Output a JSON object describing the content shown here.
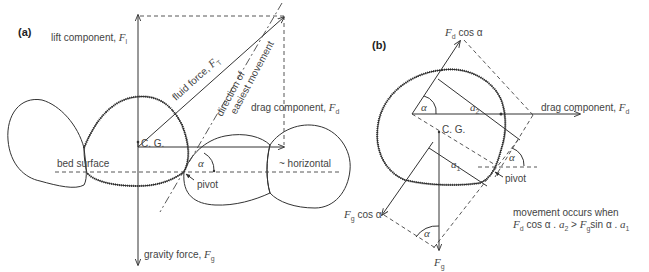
{
  "panel_a": {
    "label": "(a)",
    "lift_label": "lift component, ",
    "lift_symbol": "F",
    "lift_sub": "l",
    "fluid_label": "fluid force, ",
    "fluid_symbol": "F",
    "fluid_sub": "T",
    "direction_line1": "direction of",
    "direction_line2": "easiest movement",
    "drag_label": "drag component, ",
    "drag_symbol": "F",
    "drag_sub": "d",
    "cg_label": "C. G.",
    "bed_label": "bed surface",
    "horizontal_label": "~ horizontal",
    "alpha": "α",
    "pivot_label": "pivot",
    "gravity_label": "gravity force, ",
    "gravity_symbol": "F",
    "gravity_sub": "g"
  },
  "panel_b": {
    "label": "(b)",
    "fdcos_symbol": "F",
    "fdcos_sub": "d",
    "fdcos_text": " cos α",
    "a2_symbol": "a",
    "a2_sub": "2",
    "a1_symbol": "a",
    "a1_sub": "1",
    "drag_label": "drag component, ",
    "drag_symbol": "F",
    "drag_sub": "d",
    "cg_label": "C. G.",
    "alpha": "α",
    "pivot_label": "pivot",
    "fgcos_symbol": "F",
    "fgcos_sub": "g",
    "fgcos_text": " cos α",
    "fg_symbol": "F",
    "fg_sub": "g",
    "condition_line1": "movement occurs when",
    "condition_f1": "F",
    "condition_f1_sub": "d",
    "condition_mid1": " cos α . ",
    "condition_a2": "a",
    "condition_a2_sub": "2",
    "condition_gt": " > ",
    "condition_f2": "F",
    "condition_f2_sub": "g",
    "condition_mid2": "sin α . ",
    "condition_a1": "a",
    "condition_a1_sub": "1"
  },
  "colors": {
    "ink": "#333333",
    "background": "#ffffff"
  }
}
